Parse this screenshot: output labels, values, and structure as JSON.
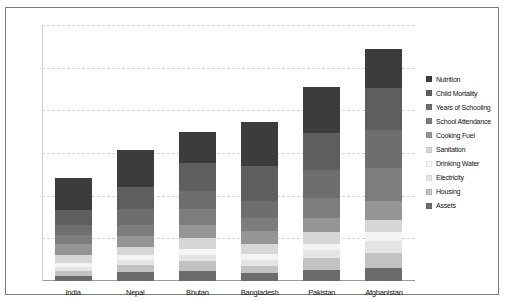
{
  "chart_data": {
    "type": "bar",
    "subtype": "stacked-bar",
    "title": "",
    "xlabel": "",
    "ylabel": "",
    "ylim": [
      0,
      0.3
    ],
    "yticks": [
      "0.30",
      "0.25",
      "0.20",
      "0.15",
      "0.10",
      "0.05"
    ],
    "ytick_values": [
      0.3,
      0.25,
      0.2,
      0.15,
      0.1,
      0.05
    ],
    "grid": "horizontal-dashed",
    "legend_position": "right",
    "categories": [
      "India",
      "Nepal",
      "Bhutan",
      "Bangladesh",
      "Pakistan",
      "Afghanistan"
    ],
    "totals": [
      0.121,
      0.154,
      0.175,
      0.186,
      0.227,
      0.272
    ],
    "series": [
      {
        "name": "Nutrition",
        "color": "#3c3c3c",
        "values": [
          0.038,
          0.044,
          0.037,
          0.051,
          0.053,
          0.046
        ]
      },
      {
        "name": "Child Mortality",
        "color": "#5e5e5e",
        "values": [
          0.017,
          0.026,
          0.033,
          0.041,
          0.044,
          0.049
        ]
      },
      {
        "name": "Years of Schooling",
        "color": "#6e6e6e",
        "values": [
          0.012,
          0.018,
          0.021,
          0.02,
          0.033,
          0.045
        ]
      },
      {
        "name": "School Attendance",
        "color": "#7d7d7d",
        "values": [
          0.01,
          0.013,
          0.018,
          0.015,
          0.023,
          0.038
        ]
      },
      {
        "name": "Cooking Fuel",
        "color": "#959595",
        "values": [
          0.013,
          0.013,
          0.016,
          0.016,
          0.017,
          0.023
        ]
      },
      {
        "name": "Sanitation",
        "color": "#d6d6d6",
        "values": [
          0.01,
          0.009,
          0.012,
          0.011,
          0.013,
          0.013
        ]
      },
      {
        "name": "Drinking Water",
        "color": "#f4f4f4",
        "values": [
          0.005,
          0.006,
          0.007,
          0.007,
          0.008,
          0.011
        ]
      },
      {
        "name": "Electricity",
        "color": "#e4e4e4",
        "values": [
          0.004,
          0.006,
          0.008,
          0.007,
          0.009,
          0.014
        ]
      },
      {
        "name": "Housing",
        "color": "#c2c2c2",
        "values": [
          0.006,
          0.009,
          0.011,
          0.009,
          0.014,
          0.018
        ]
      },
      {
        "name": "Assets",
        "color": "#6b6b6b",
        "values": [
          0.006,
          0.01,
          0.012,
          0.009,
          0.013,
          0.015
        ]
      }
    ]
  },
  "legend": {
    "items": [
      {
        "label": "Nutrition"
      },
      {
        "label": "Child Mortality"
      },
      {
        "label": "Years of Schooling"
      },
      {
        "label": "School Attendance"
      },
      {
        "label": "Cooking Fuel"
      },
      {
        "label": "Sanitation"
      },
      {
        "label": "Drinking Water"
      },
      {
        "label": "Electricity"
      },
      {
        "label": "Housing"
      },
      {
        "label": "Assets"
      }
    ]
  }
}
